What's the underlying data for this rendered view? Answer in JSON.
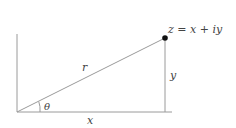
{
  "diagram": {
    "point_label": "z = x + iy",
    "hypotenuse_label": "r",
    "angle_label": "θ",
    "opposite_label": "y",
    "adjacent_label": "x",
    "colors": {
      "line": "#9a9a9a",
      "point": "#111111",
      "text": "#444444"
    }
  }
}
